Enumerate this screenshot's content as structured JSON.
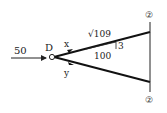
{
  "diagram": {
    "type": "truss-joint-free-body",
    "node": {
      "label": "D"
    },
    "load": {
      "value": "50"
    },
    "members": [
      {
        "label": "x",
        "direction": "upper-right"
      },
      {
        "label": "y",
        "direction": "lower-right"
      }
    ],
    "slope": {
      "hyp": "√109",
      "rise": "3",
      "run": "100"
    },
    "supports": [
      {
        "label": "②"
      },
      {
        "label": "②"
      }
    ]
  }
}
